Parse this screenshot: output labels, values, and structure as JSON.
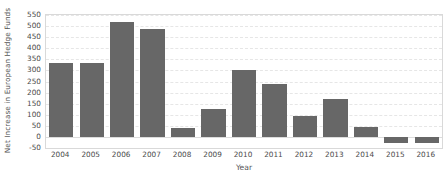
{
  "chart_data": {
    "type": "bar",
    "title": "",
    "xlabel": "Year",
    "ylabel": "Net Increase in European Hedge Funds",
    "categories": [
      "2004",
      "2005",
      "2006",
      "2007",
      "2008",
      "2009",
      "2010",
      "2011",
      "2012",
      "2013",
      "2014",
      "2015",
      "2016"
    ],
    "values": [
      332,
      332,
      520,
      485,
      40,
      125,
      300,
      240,
      95,
      172,
      45,
      -28,
      -28
    ],
    "ylim": [
      -50,
      550
    ],
    "ytickstep": 50,
    "yticks": [
      550,
      500,
      450,
      400,
      350,
      300,
      250,
      200,
      150,
      100,
      50,
      0,
      -50
    ],
    "ytick_labels": [
      "550",
      "500",
      "450",
      "400",
      "350",
      "300",
      "250",
      "200",
      "150",
      "100",
      "50",
      "0",
      "-50"
    ],
    "grid": true,
    "grid_axis": "y",
    "legend": false,
    "legend_position": "none",
    "bar_color": "#676767",
    "background_color": "#ffffff",
    "gridline_color": "#e6e6e6",
    "axis_border_color": "#d9d9d9",
    "tick_label_color": "#4a4a4a",
    "axis_title_color": "#555555"
  }
}
